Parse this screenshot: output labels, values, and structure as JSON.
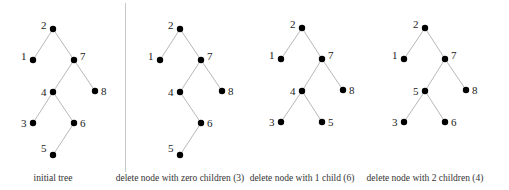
{
  "divider": {
    "x": 125,
    "y1": 3,
    "y2": 172
  },
  "trees": [
    {
      "id": "initial",
      "caption": "initial tree",
      "caption_x": 53,
      "nodes": [
        {
          "key": "2",
          "x": 53,
          "y": 29,
          "lx": -9,
          "ly": -4
        },
        {
          "key": "1",
          "x": 33,
          "y": 60,
          "lx": -9,
          "ly": -4
        },
        {
          "key": "7",
          "x": 74,
          "y": 60,
          "lx": 6,
          "ly": -4
        },
        {
          "key": "4",
          "x": 53,
          "y": 92,
          "lx": -9,
          "ly": 0
        },
        {
          "key": "8",
          "x": 95,
          "y": 91,
          "lx": 6,
          "ly": 0
        },
        {
          "key": "3",
          "x": 33,
          "y": 123,
          "lx": -9,
          "ly": 0
        },
        {
          "key": "6",
          "x": 74,
          "y": 123,
          "lx": 6,
          "ly": 0
        },
        {
          "key": "5",
          "x": 53,
          "y": 155,
          "lx": -9,
          "ly": -7
        }
      ],
      "edges": [
        [
          "2",
          "1"
        ],
        [
          "2",
          "7"
        ],
        [
          "7",
          "4"
        ],
        [
          "7",
          "8"
        ],
        [
          "4",
          "3"
        ],
        [
          "4",
          "6"
        ],
        [
          "6",
          "5"
        ]
      ]
    },
    {
      "id": "zero-children",
      "caption": "delete node with zero children (3)",
      "caption_x": 180,
      "nodes": [
        {
          "key": "2",
          "x": 180,
          "y": 29,
          "lx": -9,
          "ly": -4
        },
        {
          "key": "1",
          "x": 160,
          "y": 60,
          "lx": -9,
          "ly": -4
        },
        {
          "key": "7",
          "x": 201,
          "y": 60,
          "lx": 6,
          "ly": -4
        },
        {
          "key": "4",
          "x": 180,
          "y": 92,
          "lx": -9,
          "ly": 0
        },
        {
          "key": "8",
          "x": 222,
          "y": 91,
          "lx": 6,
          "ly": 0
        },
        {
          "key": "6",
          "x": 201,
          "y": 123,
          "lx": 6,
          "ly": 0
        },
        {
          "key": "5",
          "x": 180,
          "y": 155,
          "lx": -9,
          "ly": -7
        }
      ],
      "edges": [
        [
          "2",
          "1"
        ],
        [
          "2",
          "7"
        ],
        [
          "7",
          "4"
        ],
        [
          "7",
          "8"
        ],
        [
          "4",
          "6"
        ],
        [
          "6",
          "5"
        ]
      ]
    },
    {
      "id": "one-child",
      "caption": "delete node with 1 child (6)",
      "caption_x": 302,
      "nodes": [
        {
          "key": "2",
          "x": 302,
          "y": 28,
          "lx": -9,
          "ly": -4
        },
        {
          "key": "1",
          "x": 281,
          "y": 59,
          "lx": -9,
          "ly": -4
        },
        {
          "key": "7",
          "x": 322,
          "y": 59,
          "lx": 6,
          "ly": -4
        },
        {
          "key": "4",
          "x": 302,
          "y": 91,
          "lx": -9,
          "ly": 0
        },
        {
          "key": "8",
          "x": 343,
          "y": 90,
          "lx": 6,
          "ly": 0
        },
        {
          "key": "3",
          "x": 281,
          "y": 122,
          "lx": -9,
          "ly": 0
        },
        {
          "key": "5",
          "x": 322,
          "y": 122,
          "lx": 6,
          "ly": 0
        }
      ],
      "edges": [
        [
          "2",
          "1"
        ],
        [
          "2",
          "7"
        ],
        [
          "7",
          "4"
        ],
        [
          "7",
          "8"
        ],
        [
          "4",
          "3"
        ],
        [
          "4",
          "5"
        ]
      ]
    },
    {
      "id": "two-children",
      "caption": "delete node with 2 children (4)",
      "caption_x": 425,
      "nodes": [
        {
          "key": "2",
          "x": 425,
          "y": 28,
          "lx": -9,
          "ly": -4
        },
        {
          "key": "1",
          "x": 404,
          "y": 59,
          "lx": -9,
          "ly": -4
        },
        {
          "key": "7",
          "x": 445,
          "y": 59,
          "lx": 6,
          "ly": -4
        },
        {
          "key": "5",
          "x": 425,
          "y": 91,
          "lx": -9,
          "ly": 0
        },
        {
          "key": "8",
          "x": 466,
          "y": 90,
          "lx": 6,
          "ly": 0
        },
        {
          "key": "3",
          "x": 404,
          "y": 122,
          "lx": -9,
          "ly": 0
        },
        {
          "key": "6",
          "x": 445,
          "y": 122,
          "lx": 6,
          "ly": 0
        }
      ],
      "edges": [
        [
          "2",
          "1"
        ],
        [
          "2",
          "7"
        ],
        [
          "7",
          "5"
        ],
        [
          "7",
          "8"
        ],
        [
          "5",
          "3"
        ],
        [
          "5",
          "6"
        ]
      ]
    }
  ],
  "caption_y": 181
}
